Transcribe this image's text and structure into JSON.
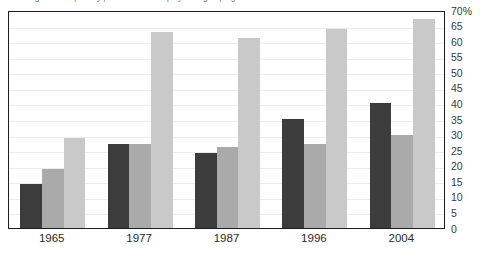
{
  "chart_data": {
    "type": "bar",
    "title": "Percentage of MPs paid by private sector employment grouping",
    "xlabel": "",
    "ylabel": "",
    "ylim": [
      0,
      70
    ],
    "ytick_step": 5,
    "grid": true,
    "grid_axis": "y",
    "legend": "none",
    "axis_label_side": "right",
    "categories": [
      "1965",
      "1977",
      "1987",
      "1996",
      "2004"
    ],
    "ytick_labels": [
      "70%",
      "65",
      "60",
      "55",
      "50",
      "45",
      "40",
      "35",
      "30",
      "25",
      "20",
      "15",
      "10",
      "5",
      "0"
    ],
    "ytick_values": [
      70,
      65,
      60,
      55,
      50,
      45,
      40,
      35,
      30,
      25,
      20,
      15,
      10,
      5,
      0
    ],
    "series": [
      {
        "name": "series-1",
        "color": "#3c3c3c",
        "values": [
          14,
          27,
          24,
          35,
          40
        ]
      },
      {
        "name": "series-2",
        "color": "#aaaaaa",
        "values": [
          19,
          27,
          26,
          27,
          30
        ]
      },
      {
        "name": "series-3",
        "color": "#c9c9c9",
        "values": [
          29,
          63,
          61,
          64,
          67
        ]
      }
    ]
  },
  "colors": {
    "frame": "#1c1c1c",
    "gridline": "#ececec",
    "background": "#ffffff",
    "title_text": "#6d6d6d",
    "axis_text": "#2a2a2a"
  }
}
